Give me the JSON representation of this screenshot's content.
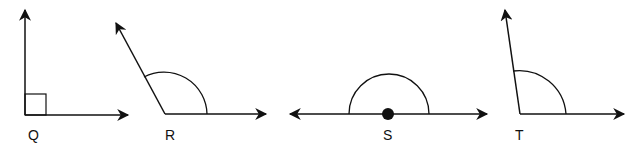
{
  "diagram": {
    "type": "angles",
    "stroke_color": "#111111",
    "background": "#ffffff",
    "angles": [
      {
        "label": "Q",
        "kind": "right",
        "marker": "square"
      },
      {
        "label": "R",
        "kind": "obtuse",
        "marker": "arc"
      },
      {
        "label": "S",
        "kind": "straight",
        "marker": "semicircle",
        "vertex_dot": true
      },
      {
        "label": "T",
        "kind": "obtuse",
        "marker": "arc"
      }
    ]
  }
}
